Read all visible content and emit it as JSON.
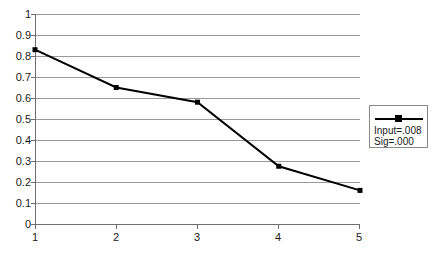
{
  "chart_data": {
    "type": "line",
    "title": "",
    "xlabel": "",
    "ylabel": "",
    "x": [
      1,
      2,
      3,
      4,
      5
    ],
    "xtick_labels": [
      "1",
      "2",
      "3",
      "4",
      "5"
    ],
    "xlim": [
      1,
      5
    ],
    "ylim": [
      0,
      1
    ],
    "ytick_labels": [
      "1",
      "0.9",
      "0.8",
      "0.7",
      "0.6",
      "0.5",
      "0.4",
      "0.3",
      "0.2",
      "0.1",
      "0"
    ],
    "ytick_values": [
      1,
      0.9,
      0.8,
      0.7,
      0.6,
      0.5,
      0.4,
      0.3,
      0.2,
      0.1,
      0
    ],
    "grid": true,
    "legend_position": "right",
    "series": [
      {
        "name": "Input=.008 Sig=.000",
        "values": [
          0.83,
          0.65,
          0.58,
          0.275,
          0.16
        ],
        "color": "#000000",
        "marker": "square"
      }
    ],
    "legend": {
      "line_1": "Input=.008",
      "line_2": "Sig=.000"
    },
    "colors": {
      "series": "#000000",
      "gridline": "#9a9a9a",
      "axis": "#6e6e6e",
      "background": "#ffffff",
      "legend_border": "#8a8a8a"
    }
  }
}
